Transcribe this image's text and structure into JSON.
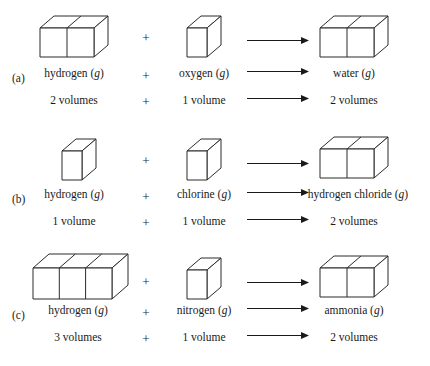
{
  "figure": {
    "type": "gas-combining-volumes-diagram",
    "rows": [
      {
        "tag": "(a)",
        "reactant1": {
          "name": "hydrogen",
          "state": "(g)",
          "volume_text": "2 volumes",
          "units": 2
        },
        "operator": "+",
        "reactant2": {
          "name": "oxygen",
          "state": "(g)",
          "volume_text": "1 volume",
          "units": 1
        },
        "product": {
          "name": "water",
          "state": "(g)",
          "volume_text": "2 volumes",
          "units": 2
        }
      },
      {
        "tag": "(b)",
        "reactant1": {
          "name": "hydrogen",
          "state": "(g)",
          "volume_text": "1 volume",
          "units": 1
        },
        "operator": "+",
        "reactant2": {
          "name": "chlorine",
          "state": "(g)",
          "volume_text": "1 volume",
          "units": 1
        },
        "product": {
          "name": "hydrogen chloride",
          "state": "(g)",
          "volume_text": "2 volumes",
          "units": 2
        }
      },
      {
        "tag": "(c)",
        "reactant1": {
          "name": "hydrogen",
          "state": "(g)",
          "volume_text": "3 volumes",
          "units": 3
        },
        "operator": "+",
        "reactant2": {
          "name": "nitrogen",
          "state": "(g)",
          "volume_text": "1 volume",
          "units": 1
        },
        "product": {
          "name": "ammonia",
          "state": "(g)",
          "volume_text": "2 volumes",
          "units": 2
        }
      }
    ],
    "colors": {
      "ink": "#1a1a1a",
      "box_stroke": "#2b2b2b",
      "box_fill": "#ffffff",
      "background": "#ffffff"
    }
  }
}
